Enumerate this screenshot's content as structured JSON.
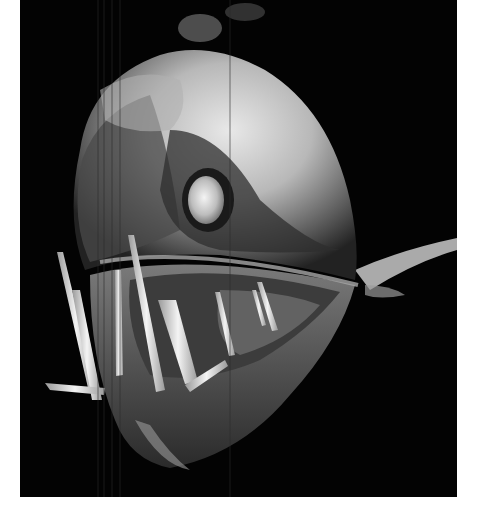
{
  "image": {
    "subject": "Deep-sea viperfish head with long fang-like teeth and large eye, black background",
    "background_color": "#030303",
    "border_color": "#ffffff",
    "tone": "grayscale"
  },
  "caption": {
    "alt_text": "Close-up photograph of a deep-sea fish head with large transparent fangs"
  }
}
